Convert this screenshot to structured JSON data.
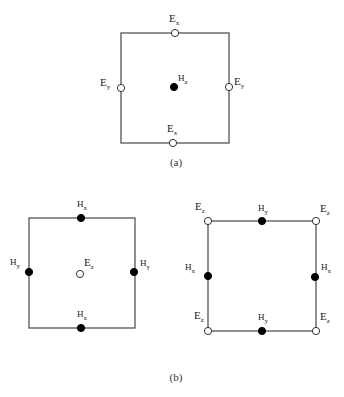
{
  "figure": {
    "panel_a": {
      "caption": "(a)",
      "box": {
        "x1": 121,
        "y1": 33,
        "x2": 229,
        "y2": 143
      },
      "nodes": [
        {
          "id": "ex-top",
          "field": "E",
          "sub": "x",
          "type": "hollow",
          "x": 175,
          "y": 33,
          "lx": 169,
          "ly": 22
        },
        {
          "id": "ex-bottom",
          "field": "E",
          "sub": "x",
          "type": "hollow",
          "x": 173,
          "y": 143,
          "lx": 167,
          "ly": 132
        },
        {
          "id": "ey-left",
          "field": "E",
          "sub": "y",
          "type": "hollow",
          "x": 121,
          "y": 88,
          "lx": 100,
          "ly": 86
        },
        {
          "id": "ey-right",
          "field": "E",
          "sub": "y",
          "type": "hollow",
          "x": 229,
          "y": 87,
          "lx": 234,
          "ly": 85
        },
        {
          "id": "hz-center",
          "field": "H",
          "sub": "z",
          "type": "filled",
          "x": 174,
          "y": 87,
          "lx": 178,
          "ly": 81
        }
      ]
    },
    "panel_b_left": {
      "box": {
        "x1": 29,
        "y1": 218,
        "x2": 135,
        "y2": 328
      },
      "nodes": [
        {
          "id": "hx-top",
          "field": "H",
          "sub": "x",
          "type": "filled",
          "x": 81,
          "y": 218,
          "lx": 77,
          "ly": 207
        },
        {
          "id": "hx-bottom",
          "field": "H",
          "sub": "x",
          "type": "filled",
          "x": 81,
          "y": 328,
          "lx": 77,
          "ly": 317
        },
        {
          "id": "hy-left",
          "field": "H",
          "sub": "y",
          "type": "filled",
          "x": 29,
          "y": 272,
          "lx": 10,
          "ly": 265
        },
        {
          "id": "hy-right",
          "field": "H",
          "sub": "y",
          "type": "filled",
          "x": 134,
          "y": 272,
          "lx": 140,
          "ly": 266
        },
        {
          "id": "ez-center",
          "field": "E",
          "sub": "z",
          "type": "hollow",
          "x": 80,
          "y": 274,
          "lx": 84,
          "ly": 266
        }
      ]
    },
    "panel_b_right": {
      "box": {
        "x1": 208,
        "y1": 221,
        "x2": 316,
        "y2": 331
      },
      "nodes": [
        {
          "id": "ez-tl",
          "field": "E",
          "sub": "z",
          "type": "hollow",
          "x": 208,
          "y": 221,
          "lx": 195,
          "ly": 210
        },
        {
          "id": "ez-tr",
          "field": "E",
          "sub": "z",
          "type": "hollow",
          "x": 316,
          "y": 221,
          "lx": 320,
          "ly": 212
        },
        {
          "id": "ez-bl",
          "field": "E",
          "sub": "z",
          "type": "hollow",
          "x": 208,
          "y": 331,
          "lx": 194,
          "ly": 319
        },
        {
          "id": "ez-br",
          "field": "E",
          "sub": "z",
          "type": "hollow",
          "x": 316,
          "y": 331,
          "lx": 320,
          "ly": 320
        },
        {
          "id": "hy-top",
          "field": "H",
          "sub": "y",
          "type": "filled",
          "x": 262,
          "y": 221,
          "lx": 258,
          "ly": 211
        },
        {
          "id": "hy-bottom",
          "field": "H",
          "sub": "y",
          "type": "filled",
          "x": 262,
          "y": 331,
          "lx": 258,
          "ly": 320
        },
        {
          "id": "hx-left",
          "field": "H",
          "sub": "x",
          "type": "filled",
          "x": 208,
          "y": 276,
          "lx": 185,
          "ly": 270
        },
        {
          "id": "hx-right",
          "field": "H",
          "sub": "x",
          "type": "filled",
          "x": 315,
          "y": 277,
          "lx": 321,
          "ly": 270
        }
      ]
    },
    "panel_b_caption": "(b)",
    "caption_a_pos": {
      "x": 176,
      "y": 166
    },
    "caption_b_pos": {
      "x": 176,
      "y": 381
    },
    "colors": {
      "line": "#555555",
      "filled": "#000000",
      "hollow_fill": "#ffffff",
      "hollow_stroke": "#333333"
    }
  }
}
